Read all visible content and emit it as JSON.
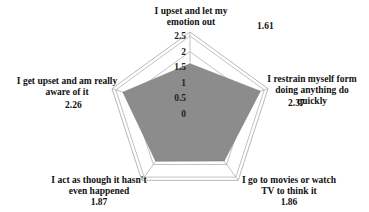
{
  "chart_data": {
    "type": "radar",
    "title": "",
    "categories": [
      "I upset and let my emotion out",
      "I restrain myself form doing anything do quickly",
      "I go to movies or watch TV to think it",
      "I act as though it hasn't even happened",
      "I get upset and am really aware of it"
    ],
    "series": [
      {
        "name": "Score",
        "values": [
          1.61,
          2.37,
          1.86,
          1.87,
          2.26
        ],
        "color": "#8c8c8c"
      }
    ],
    "ticks": [
      "0",
      "0.5",
      "1",
      "1.5",
      "2",
      "2.5"
    ],
    "rlim": [
      0,
      2.5
    ],
    "grid": true,
    "legend": "none"
  },
  "labels": {
    "top": {
      "line1": "I upset and let my",
      "line2": "emotion out",
      "value": "1.61"
    },
    "right": {
      "line1": "I restrain myself form",
      "line2": "doing anything do",
      "line3": "quickly",
      "value": "2.37"
    },
    "bottom_right": {
      "line1": "I go to movies or watch",
      "line2": "TV to think it",
      "value": "1.86"
    },
    "bottom_left": {
      "line1": "I act as though it hasn't",
      "line2": "even happened",
      "value": "1.87"
    },
    "left": {
      "line1": "I get upset and am really",
      "line2": "aware of it",
      "value": "2.26"
    }
  }
}
